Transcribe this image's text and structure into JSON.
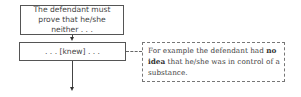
{
  "diagram": {
    "box1": {
      "text": "The defendant must prove that he/she neither . . ."
    },
    "box2": {
      "text": ". . . [knew] . . ."
    },
    "note": {
      "text_before": "For example the defendant had ",
      "text_bold1": "no",
      "text_mid": " ",
      "text_bold2": "idea",
      "text_after": " that he/she was in control of a substance."
    }
  }
}
